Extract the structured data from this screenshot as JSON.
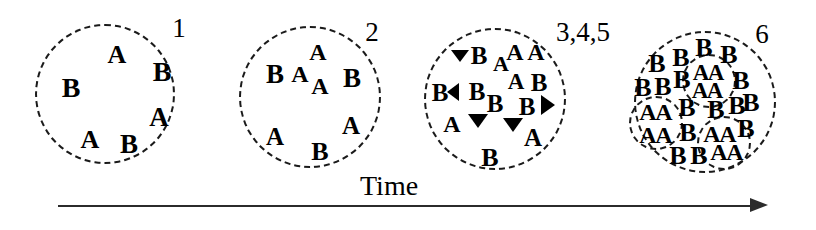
{
  "figure": {
    "background_color": "#ffffff",
    "ink_color": "#000000",
    "axis": {
      "label": "Time",
      "direction": "left-to-right",
      "arrowhead": "right-arrow-icon"
    }
  },
  "stages": [
    {
      "id": "stage-1",
      "label": "1",
      "label_x": 179,
      "label_y": 28,
      "circle": {
        "cx": 105,
        "cy": 94,
        "r": 70
      },
      "letters": [
        {
          "t": "A",
          "x": 117,
          "y": 55,
          "size": 26
        },
        {
          "t": "B",
          "x": 71,
          "y": 88,
          "size": 28
        },
        {
          "t": "B",
          "x": 162,
          "y": 72,
          "size": 28
        },
        {
          "t": "A",
          "x": 159,
          "y": 117,
          "size": 27
        },
        {
          "t": "A",
          "x": 90,
          "y": 140,
          "size": 26
        },
        {
          "t": "B",
          "x": 129,
          "y": 144,
          "size": 27
        }
      ],
      "arrows": [],
      "subcircles": []
    },
    {
      "id": "stage-2",
      "label": "2",
      "label_x": 372,
      "label_y": 32,
      "circle": {
        "cx": 310,
        "cy": 97,
        "r": 71
      },
      "letters": [
        {
          "t": "A",
          "x": 318,
          "y": 52,
          "size": 24
        },
        {
          "t": "B",
          "x": 275,
          "y": 74,
          "size": 27
        },
        {
          "t": "A",
          "x": 300,
          "y": 74,
          "size": 24
        },
        {
          "t": "A",
          "x": 320,
          "y": 86,
          "size": 24
        },
        {
          "t": "B",
          "x": 352,
          "y": 78,
          "size": 27
        },
        {
          "t": "A",
          "x": 275,
          "y": 136,
          "size": 25
        },
        {
          "t": "B",
          "x": 320,
          "y": 152,
          "size": 26
        },
        {
          "t": "A",
          "x": 351,
          "y": 125,
          "size": 25
        }
      ],
      "arrows": [],
      "subcircles": []
    },
    {
      "id": "stage-345",
      "label": "3,4,5",
      "label_x": 583,
      "label_y": 32,
      "circle": {
        "cx": 495,
        "cy": 99,
        "r": 71
      },
      "letters": [
        {
          "t": "B",
          "x": 479,
          "y": 55,
          "size": 25
        },
        {
          "t": "A",
          "x": 501,
          "y": 64,
          "size": 22
        },
        {
          "t": "A",
          "x": 515,
          "y": 52,
          "size": 24
        },
        {
          "t": "A",
          "x": 536,
          "y": 52,
          "size": 24
        },
        {
          "t": "B",
          "x": 440,
          "y": 92,
          "size": 25
        },
        {
          "t": "B",
          "x": 477,
          "y": 91,
          "size": 25
        },
        {
          "t": "A",
          "x": 516,
          "y": 81,
          "size": 23
        },
        {
          "t": "B",
          "x": 539,
          "y": 82,
          "size": 25
        },
        {
          "t": "B",
          "x": 495,
          "y": 103,
          "size": 25
        },
        {
          "t": "B",
          "x": 527,
          "y": 106,
          "size": 25
        },
        {
          "t": "A",
          "x": 452,
          "y": 124,
          "size": 24
        },
        {
          "t": "A",
          "x": 533,
          "y": 137,
          "size": 25
        },
        {
          "t": "B",
          "x": 490,
          "y": 158,
          "size": 26
        }
      ],
      "arrows": [
        {
          "name": "arrow-left-upper",
          "x": 460,
          "y": 59,
          "dir": "down",
          "size": 9
        },
        {
          "name": "arrow-left-middle",
          "x": 456,
          "y": 92,
          "dir": "left",
          "size": 9
        },
        {
          "name": "arrow-down-left",
          "x": 478,
          "y": 124,
          "dir": "down",
          "size": 10
        },
        {
          "name": "arrow-right",
          "x": 551,
          "y": 105,
          "dir": "right",
          "size": 10
        },
        {
          "name": "arrow-down-right",
          "x": 513,
          "y": 128,
          "dir": "down",
          "size": 10
        }
      ],
      "subcircles": []
    },
    {
      "id": "stage-6",
      "label": "6",
      "label_x": 762,
      "label_y": 34,
      "circle": {
        "cx": 705,
        "cy": 102,
        "r": 71
      },
      "letters": [
        {
          "t": "B",
          "x": 657,
          "y": 64,
          "size": 26
        },
        {
          "t": "B",
          "x": 681,
          "y": 58,
          "size": 26
        },
        {
          "t": "B",
          "x": 704,
          "y": 48,
          "size": 26
        },
        {
          "t": "B",
          "x": 729,
          "y": 55,
          "size": 26
        },
        {
          "t": "B",
          "x": 643,
          "y": 88,
          "size": 26
        },
        {
          "t": "B",
          "x": 663,
          "y": 87,
          "size": 26
        },
        {
          "t": "B",
          "x": 682,
          "y": 80,
          "size": 26
        },
        {
          "t": "A",
          "x": 701,
          "y": 72,
          "size": 23
        },
        {
          "t": "A",
          "x": 716,
          "y": 72,
          "size": 23
        },
        {
          "t": "B",
          "x": 741,
          "y": 81,
          "size": 26
        },
        {
          "t": "A",
          "x": 700,
          "y": 90,
          "size": 23
        },
        {
          "t": "A",
          "x": 715,
          "y": 90,
          "size": 23
        },
        {
          "t": "B",
          "x": 751,
          "y": 103,
          "size": 26
        },
        {
          "t": "A",
          "x": 648,
          "y": 112,
          "size": 24
        },
        {
          "t": "A",
          "x": 664,
          "y": 112,
          "size": 24
        },
        {
          "t": "B",
          "x": 687,
          "y": 108,
          "size": 26
        },
        {
          "t": "B",
          "x": 716,
          "y": 110,
          "size": 26
        },
        {
          "t": "B",
          "x": 737,
          "y": 106,
          "size": 26
        },
        {
          "t": "A",
          "x": 648,
          "y": 135,
          "size": 24
        },
        {
          "t": "A",
          "x": 664,
          "y": 135,
          "size": 24
        },
        {
          "t": "B",
          "x": 688,
          "y": 133,
          "size": 26
        },
        {
          "t": "A",
          "x": 712,
          "y": 134,
          "size": 24
        },
        {
          "t": "A",
          "x": 728,
          "y": 134,
          "size": 24
        },
        {
          "t": "B",
          "x": 746,
          "y": 129,
          "size": 26
        },
        {
          "t": "B",
          "x": 678,
          "y": 156,
          "size": 26
        },
        {
          "t": "B",
          "x": 699,
          "y": 156,
          "size": 26
        },
        {
          "t": "A",
          "x": 719,
          "y": 152,
          "size": 24
        },
        {
          "t": "A",
          "x": 735,
          "y": 152,
          "size": 24
        }
      ],
      "arrows": [],
      "subcircles": [
        {
          "name": "subcluster-top",
          "cx": 709,
          "cy": 81,
          "r": 27
        },
        {
          "name": "subcluster-left",
          "cx": 656,
          "cy": 123,
          "r": 27
        },
        {
          "name": "subcluster-bottom",
          "cx": 724,
          "cy": 143,
          "r": 27
        }
      ]
    }
  ]
}
